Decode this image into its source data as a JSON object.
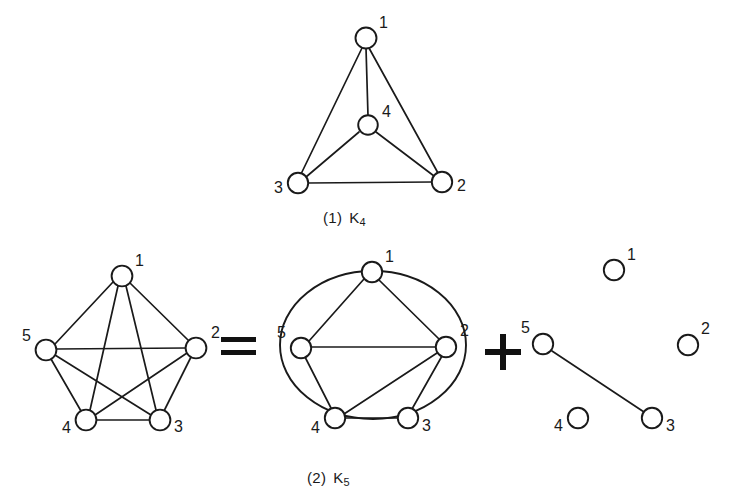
{
  "figure": {
    "background_color": "#ffffff",
    "ink_color": "#1a1a1a",
    "panels": [
      {
        "id": "k4",
        "caption_index": "(1)",
        "caption_name": "K",
        "caption_sub": "4",
        "graph": "complete-graph-k4",
        "nodes": [
          {
            "id": "1",
            "label": "1",
            "x": 366,
            "y": 38,
            "label_dx": 13,
            "label_dy": -10
          },
          {
            "id": "2",
            "label": "2",
            "x": 442,
            "y": 182,
            "label_dx": 15,
            "label_dy": 9
          },
          {
            "id": "3",
            "label": "3",
            "x": 298,
            "y": 183,
            "label_dx": -25,
            "label_dy": 10
          },
          {
            "id": "4",
            "label": "4",
            "x": 368,
            "y": 125,
            "label_dx": 14,
            "label_dy": -8
          }
        ],
        "edges": [
          [
            "1",
            "2"
          ],
          [
            "1",
            "3"
          ],
          [
            "1",
            "4"
          ],
          [
            "2",
            "3"
          ],
          [
            "2",
            "4"
          ],
          [
            "3",
            "4"
          ]
        ]
      },
      {
        "id": "k5-complete",
        "graph": "complete-graph-k5",
        "nodes": [
          {
            "id": "1",
            "label": "1",
            "x": 122,
            "y": 276,
            "label_dx": 13,
            "label_dy": -11
          },
          {
            "id": "2",
            "label": "2",
            "x": 196,
            "y": 348,
            "label_dx": 15,
            "label_dy": -11
          },
          {
            "id": "3",
            "label": "3",
            "x": 160,
            "y": 420,
            "label_dx": 15,
            "label_dy": 11
          },
          {
            "id": "4",
            "label": "4",
            "x": 86,
            "y": 420,
            "label_dx": -24,
            "label_dy": 12
          },
          {
            "id": "5",
            "label": "5",
            "x": 46,
            "y": 350,
            "label_dx": -24,
            "label_dy": -10
          }
        ],
        "edges": [
          [
            "1",
            "2"
          ],
          [
            "1",
            "3"
          ],
          [
            "1",
            "4"
          ],
          [
            "1",
            "5"
          ],
          [
            "2",
            "3"
          ],
          [
            "2",
            "4"
          ],
          [
            "2",
            "5"
          ],
          [
            "3",
            "4"
          ],
          [
            "3",
            "5"
          ],
          [
            "4",
            "5"
          ]
        ]
      },
      {
        "id": "k5-planar-part",
        "graph": "planar-subgraph-with-outer-cycle",
        "nodes": [
          {
            "id": "1",
            "label": "1",
            "x": 372,
            "y": 272,
            "label_dx": 13,
            "label_dy": -11
          },
          {
            "id": "2",
            "label": "2",
            "x": 446,
            "y": 347,
            "label_dx": 14,
            "label_dy": -12
          },
          {
            "id": "3",
            "label": "3",
            "x": 408,
            "y": 418,
            "label_dx": 15,
            "label_dy": 11
          },
          {
            "id": "4",
            "label": "4",
            "x": 335,
            "y": 418,
            "label_dx": -24,
            "label_dy": 13
          },
          {
            "id": "5",
            "label": "5",
            "x": 301,
            "y": 348,
            "label_dx": -24,
            "label_dy": -11
          }
        ],
        "edges": [
          [
            "1",
            "2"
          ],
          [
            "1",
            "5"
          ],
          [
            "2",
            "3"
          ],
          [
            "2",
            "4"
          ],
          [
            "2",
            "5"
          ],
          [
            "3",
            "4"
          ],
          [
            "4",
            "5"
          ]
        ],
        "outer_cycle_label": "enclosing-ellipse"
      },
      {
        "id": "k5-remainder",
        "graph": "remaining-edges-subgraph",
        "nodes": [
          {
            "id": "1",
            "label": "1",
            "x": 614,
            "y": 270,
            "label_dx": 13,
            "label_dy": -11
          },
          {
            "id": "2",
            "label": "2",
            "x": 688,
            "y": 345,
            "label_dx": 14,
            "label_dy": -12
          },
          {
            "id": "3",
            "label": "3",
            "x": 652,
            "y": 418,
            "label_dx": 15,
            "label_dy": 11
          },
          {
            "id": "4",
            "label": "4",
            "x": 578,
            "y": 418,
            "label_dx": -24,
            "label_dy": 13
          },
          {
            "id": "5",
            "label": "5",
            "x": 543,
            "y": 344,
            "label_dx": -22,
            "label_dy": -13
          }
        ],
        "edges": [
          [
            "5",
            "3"
          ]
        ]
      }
    ],
    "captions": [
      {
        "id": "caption-k4",
        "index": "(1)",
        "name": "K",
        "sub": "4"
      },
      {
        "id": "caption-k5",
        "index": "(2)",
        "name": "K",
        "sub": "5"
      }
    ],
    "operators": [
      {
        "id": "equals-sign",
        "symbol": "=",
        "name": "equals-operator"
      },
      {
        "id": "plus-sign",
        "symbol": "+",
        "name": "plus-operator"
      }
    ]
  }
}
